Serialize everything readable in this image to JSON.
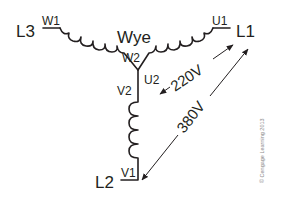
{
  "diagram": {
    "title": "Wye",
    "lines": {
      "l1": "L1",
      "l2": "L2",
      "l3": "L3"
    },
    "terminals": {
      "u1": "U1",
      "u2": "U2",
      "v1": "V1",
      "v2": "V2",
      "w1": "W1",
      "w2": "W2"
    },
    "voltages": {
      "phase": "220V",
      "line": "380V"
    },
    "copyright": "© Cengage Learning 2013",
    "colors": {
      "ink": "#231f20",
      "background": "#ffffff"
    }
  }
}
